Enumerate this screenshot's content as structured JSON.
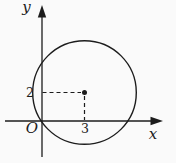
{
  "theme": {
    "bg": "#fafafa",
    "ink": "#1c1c1c"
  },
  "figure": {
    "type": "coordinate-geometry-diagram",
    "x_axis_label": "x",
    "y_axis_label": "y",
    "origin_label": "O",
    "center_x_value": "3",
    "center_y_value": "2",
    "circle": {
      "center": {
        "x": 3,
        "y": 2
      },
      "passes_through_origin": true
    }
  }
}
